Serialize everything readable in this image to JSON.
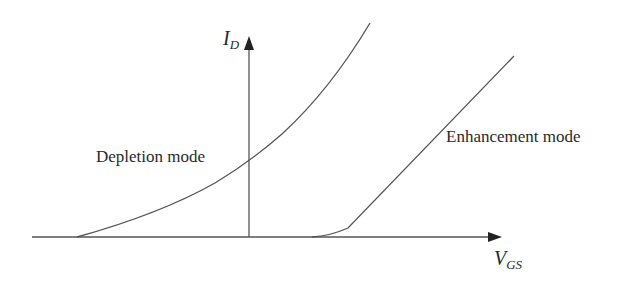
{
  "diagram": {
    "axes": {
      "y_label_main": "I",
      "y_label_sub": "D",
      "x_label_main": "V",
      "x_label_sub": "GS"
    },
    "curves": [
      {
        "name": "depletion",
        "label": "Depletion mode"
      },
      {
        "name": "enhancement",
        "label": "Enhancement mode"
      }
    ],
    "colors": {
      "line": "#555555",
      "text": "#2a2a2a",
      "background": "#ffffff"
    }
  }
}
